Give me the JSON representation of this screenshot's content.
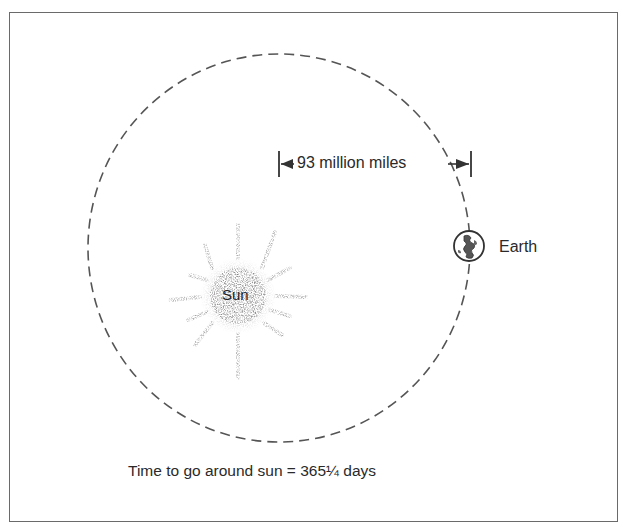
{
  "diagram": {
    "distance_label": "93 million miles",
    "earth_label": "Earth",
    "sun_label": "Sun",
    "caption": "Time to go around sun = 365¼ days"
  },
  "colors": {
    "line": "#555555",
    "sun": "#7a7a7a",
    "border": "#6a6a6a"
  }
}
